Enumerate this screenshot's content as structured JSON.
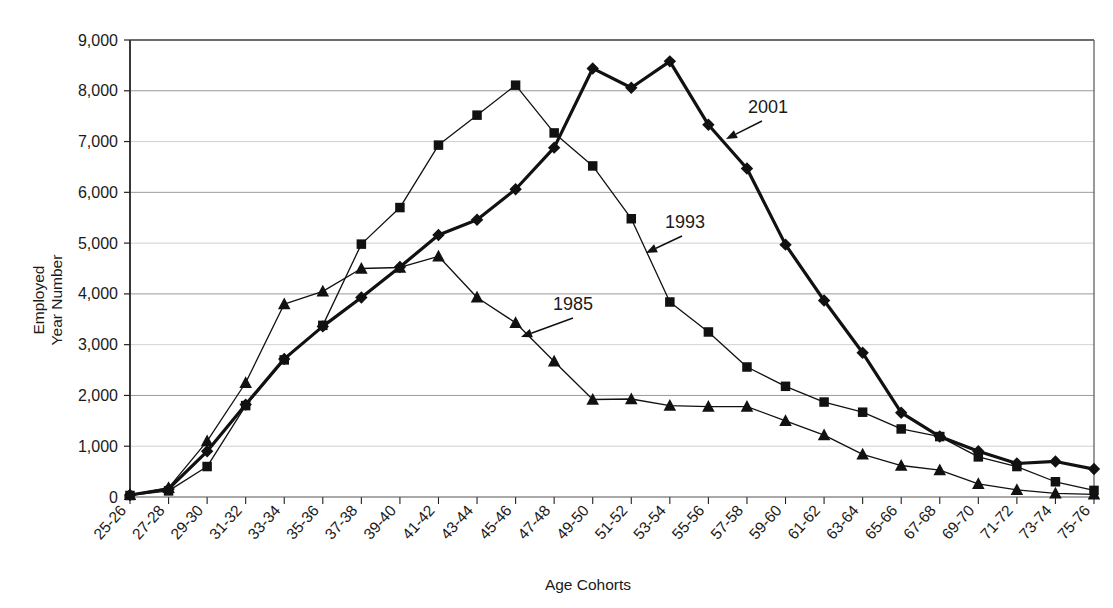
{
  "chart_data": {
    "type": "line",
    "title": "",
    "xlabel": "Age Cohorts",
    "ylabel_line1": "Employed",
    "ylabel_line2": "Year Number",
    "ylim": [
      0,
      9000
    ],
    "ytick_step": 1000,
    "ytick_labels": [
      "0",
      "1,000",
      "2,000",
      "3,000",
      "4,000",
      "5,000",
      "6,000",
      "7,000",
      "8,000",
      "9,000"
    ],
    "ytick_values": [
      0,
      1000,
      2000,
      3000,
      4000,
      5000,
      6000,
      7000,
      8000,
      9000
    ],
    "grid": true,
    "legend_position": "inline-annotations",
    "categories": [
      "25-26",
      "27-28",
      "29-30",
      "31-32",
      "33-34",
      "35-36",
      "37-38",
      "39-40",
      "41-42",
      "43-44",
      "45-46",
      "47-48",
      "49-50",
      "51-52",
      "53-54",
      "55-56",
      "57-58",
      "59-60",
      "61-62",
      "63-64",
      "65-66",
      "67-68",
      "69-70",
      "71-72",
      "73-74",
      "75-76"
    ],
    "series": [
      {
        "name": "1985",
        "marker": "triangle",
        "line_width": 1.3,
        "color": "#111111",
        "values": [
          40,
          180,
          1100,
          2250,
          3800,
          4050,
          4500,
          4520,
          4740,
          3930,
          3430,
          2670,
          1920,
          1930,
          1800,
          1780,
          1780,
          1500,
          1220,
          840,
          620,
          530,
          260,
          140,
          70,
          50
        ]
      },
      {
        "name": "1993",
        "marker": "square",
        "line_width": 1.3,
        "color": "#111111",
        "values": [
          30,
          120,
          600,
          1800,
          2700,
          3380,
          4980,
          5700,
          6930,
          7520,
          8110,
          7170,
          6520,
          5480,
          3840,
          3250,
          2560,
          2180,
          1870,
          1670,
          1340,
          1190,
          790,
          600,
          300,
          130
        ]
      },
      {
        "name": "2001",
        "marker": "diamond",
        "line_width": 3.2,
        "color": "#111111",
        "values": [
          40,
          160,
          900,
          1820,
          2720,
          3360,
          3930,
          4530,
          5160,
          5460,
          6060,
          6880,
          8440,
          8060,
          8580,
          7330,
          6470,
          4970,
          3870,
          2840,
          1660,
          1190,
          900,
          660,
          700,
          550
        ]
      }
    ],
    "annotations": [
      {
        "text": "1985",
        "label_x": 553,
        "label_y": 310,
        "arrow_from_x": 573,
        "arrow_from_y": 318,
        "arrow_to_x": 521,
        "arrow_to_y": 337
      },
      {
        "text": "1993",
        "label_x": 665,
        "label_y": 228,
        "arrow_from_x": 682,
        "arrow_from_y": 236,
        "arrow_to_x": 646,
        "arrow_to_y": 253
      },
      {
        "text": "2001",
        "label_x": 748,
        "label_y": 113,
        "arrow_from_x": 762,
        "arrow_from_y": 121,
        "arrow_to_x": 726,
        "arrow_to_y": 139
      }
    ]
  }
}
